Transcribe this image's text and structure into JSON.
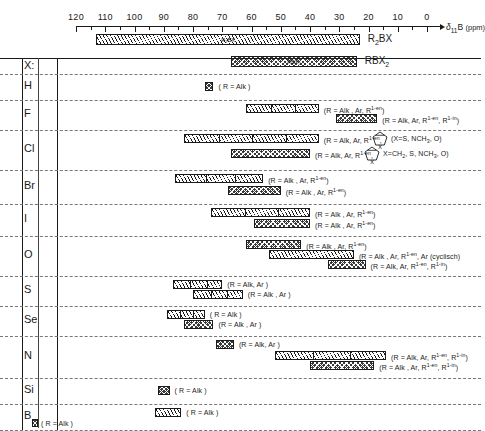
{
  "chart_data": {
    "type": "bar",
    "xlabel": "δ11B (ppm)",
    "axis": {
      "label_delta": "δ",
      "label_sub": "11",
      "label_element": "B",
      "label_units": "(ppm)",
      "min": 0,
      "max": 120,
      "direction": "reversed",
      "major_ticks": [
        120,
        110,
        100,
        90,
        80,
        70,
        60,
        50,
        40,
        30,
        20,
        10,
        0
      ],
      "minor_ticks": [
        115,
        105,
        95,
        85,
        75,
        65,
        55,
        45,
        35,
        25,
        15,
        5
      ],
      "tick_labels": [
        "120",
        "110",
        "100",
        "90",
        "80",
        "70",
        "60",
        "50",
        "40",
        "30",
        "20",
        "10",
        "0"
      ]
    },
    "reference_bars": [
      {
        "label": "R2BX",
        "label_html": "R<sub>2</sub>BX",
        "inner_label": "R₂BX",
        "pattern": "hatch",
        "from": 113,
        "to": 23
      },
      {
        "label": "RBX2",
        "label_html": "RBX<sub>2</sub>",
        "inner_label": "RBX₂",
        "pattern": "cross",
        "from": 67,
        "to": 24
      }
    ],
    "row_header": "X:",
    "rows": [
      {
        "label": "H",
        "bars": [
          {
            "pattern": "cross",
            "from": 76,
            "to": 73,
            "segments": 0,
            "caption": "( R = Alk )"
          }
        ]
      },
      {
        "label": "F",
        "bars": [
          {
            "pattern": "hatch",
            "from": 62,
            "to": 37,
            "segments": 2,
            "caption": "(R = Alk , Ar,  R^1-en)"
          },
          {
            "pattern": "cross",
            "from": 31,
            "to": 17,
            "segments": 0,
            "caption": "(R = Alk, Ar, R^1-en, R^1-in)"
          }
        ]
      },
      {
        "label": "Cl",
        "bars": [
          {
            "pattern": "hatch",
            "from": 83,
            "to": 37,
            "segments": 3,
            "caption": "(R = Alk, Ar, R^1-en,",
            "ring": {
              "x": 370,
              "label": "X",
              "annotation": "(X=S, NCH3, O)"
            }
          },
          {
            "pattern": "cross",
            "from": 67,
            "to": 40,
            "segments": 0,
            "caption": "(R = Alk, Ar, R^1-en,",
            "ring": {
              "x": 362,
              "label": "X",
              "annotation": "X=CH2, S, NCH3, O)"
            }
          }
        ]
      },
      {
        "label": "Br",
        "bars": [
          {
            "pattern": "hatch",
            "from": 86,
            "to": 56,
            "segments": 2,
            "caption": "(R = Alk , Ar,  R^1-en)"
          },
          {
            "pattern": "cross",
            "from": 68,
            "to": 50,
            "segments": 0,
            "caption": "(R = Alk , Ar,  R^1-en)"
          }
        ]
      },
      {
        "label": "I",
        "bars": [
          {
            "pattern": "hatch",
            "from": 74,
            "to": 40,
            "segments": 2,
            "caption": "(R = Alk , Ar,  R^1-en)"
          },
          {
            "pattern": "cross",
            "from": 59,
            "to": 40,
            "segments": 0,
            "caption": "(R = Alk , Ar,  R^1-en)"
          }
        ]
      },
      {
        "label": "O",
        "bars": [
          {
            "pattern": "cross",
            "from": 62,
            "to": 43,
            "segments": 0,
            "caption": "(R = Alk , Ar,  R^1-en)"
          },
          {
            "pattern": "hatch",
            "from": 54,
            "to": 25,
            "segments": 0,
            "caption": "(R = Alk , Ar, R^1-en, Ar (cyclisch)"
          },
          {
            "pattern": "cross",
            "from": 34,
            "to": 21,
            "segments": 0,
            "caption": "(R = Alk, Ar, R^1-en, R^1-in)"
          }
        ]
      },
      {
        "label": "S",
        "bars": [
          {
            "pattern": "hatch",
            "from": 87,
            "to": 70,
            "segments": 2,
            "caption": "(R = Alk, Ar )"
          },
          {
            "pattern": "hatch",
            "from": 80,
            "to": 63,
            "segments": 2,
            "caption": "(R = Alk , Ar )"
          }
        ]
      },
      {
        "label": "Se",
        "bars": [
          {
            "pattern": "hatch",
            "from": 89,
            "to": 76,
            "segments": 2,
            "caption": "( R = Alk )"
          },
          {
            "pattern": "cross",
            "from": 83,
            "to": 73,
            "segments": 0,
            "caption": "(R = Alk , Ar )"
          }
        ]
      },
      {
        "label": "N",
        "bars": [
          {
            "pattern": "cross",
            "from": 72,
            "to": 66,
            "segments": 0,
            "caption": "(R = Alk, Ar )"
          },
          {
            "pattern": "hatch",
            "from": 52,
            "to": 14,
            "segments": 2,
            "caption": "(R = Alk, Ar, R^1-en, R^1-in)"
          },
          {
            "pattern": "cross",
            "from": 40,
            "to": 18,
            "segments": 0,
            "caption": "(R = Alk , Ar,  R^1-en, R^1-in)"
          }
        ]
      },
      {
        "label": "Si",
        "bars": [
          {
            "pattern": "cross",
            "from": 92,
            "to": 88,
            "segments": 0,
            "caption": "( R = Alk )"
          }
        ]
      },
      {
        "label": "B",
        "bars": [
          {
            "pattern": "hatch",
            "from": 93,
            "to": 84,
            "segments": 0,
            "caption": "( R = Alk )"
          },
          {
            "pattern": "cross",
            "from": 133,
            "to": 131,
            "segments": 0,
            "caption": "( R = Alk )",
            "outside": true
          }
        ]
      }
    ]
  }
}
